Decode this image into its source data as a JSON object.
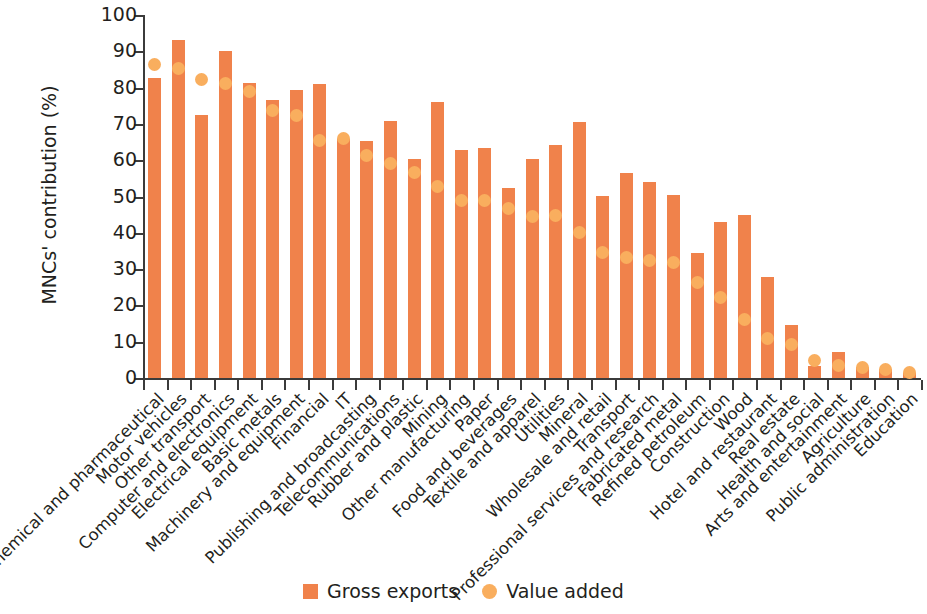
{
  "chart_data": {
    "type": "bar",
    "title": "",
    "subtitle": "",
    "xlabel": "",
    "ylabel": "MNCs' contribution (%)",
    "ylim": [
      0,
      100
    ],
    "ytick_labels": [
      "0",
      "10",
      "20",
      "30",
      "40",
      "50",
      "60",
      "70",
      "80",
      "90",
      "100"
    ],
    "ytick_values": [
      0,
      10,
      20,
      30,
      40,
      50,
      60,
      70,
      80,
      90,
      100
    ],
    "grid": false,
    "legend_position": "bottom-center",
    "colors": {
      "gross_exports": "#F0824B",
      "value_added": "#F9AE5E",
      "axis": "#3b3b3b",
      "text": "#231f20",
      "background": "#ffffff"
    },
    "categories": [
      "Chemical and pharmaceutical",
      "Motor vehicles",
      "Other transport",
      "Computer and electronics",
      "Electrical equipment",
      "Basic metals",
      "Machinery and equipment",
      "Financial",
      "IT",
      "Publishing and broadcasting",
      "Telecommunications",
      "Rubber and plastic",
      "Mining",
      "Other manufacturing",
      "Paper",
      "Food and beverages",
      "Textile and apparel",
      "Utilities",
      "Mineral",
      "Wholesale and retail",
      "Transport",
      "Professional services and research",
      "Fabricated metal",
      "Refined petroleum",
      "Construction",
      "Wood",
      "Hotel and restaurant",
      "Real estate",
      "Health and social",
      "Arts and entertainment",
      "Agriculture",
      "Public administration",
      "Education"
    ],
    "series": [
      {
        "name": "Gross exports",
        "marker": "bar",
        "color": "#F0824B",
        "values": [
          82.7,
          93.2,
          72.4,
          90.0,
          81.2,
          76.7,
          79.3,
          81.0,
          65.8,
          65.2,
          70.8,
          60.4,
          76.0,
          62.9,
          63.5,
          52.4,
          60.4,
          64.3,
          70.4,
          50.2,
          56.5,
          53.9,
          50.5,
          34.4,
          43.0,
          44.8,
          27.7,
          14.5,
          3.3,
          7.2,
          3.1,
          2.6,
          1.3
        ]
      },
      {
        "name": "Value added",
        "marker": "circle",
        "color": "#F9AE5E",
        "values": [
          86.4,
          85.3,
          82.2,
          81.2,
          78.8,
          73.8,
          72.2,
          65.5,
          66.0,
          61.4,
          59.0,
          56.5,
          52.8,
          49.0,
          48.8,
          46.8,
          44.5,
          44.8,
          40.0,
          34.7,
          33.3,
          32.4,
          31.8,
          26.4,
          22.3,
          16.2,
          11.0,
          9.3,
          4.7,
          3.4,
          2.8,
          2.3,
          1.4
        ]
      }
    ]
  },
  "legend": {
    "items": [
      {
        "label": "Gross exports",
        "swatch": "square",
        "color": "#F0824B",
        "icon": "square-swatch-icon"
      },
      {
        "label": "Value added",
        "swatch": "circle",
        "color": "#F9AE5E",
        "icon": "circle-swatch-icon"
      }
    ]
  }
}
